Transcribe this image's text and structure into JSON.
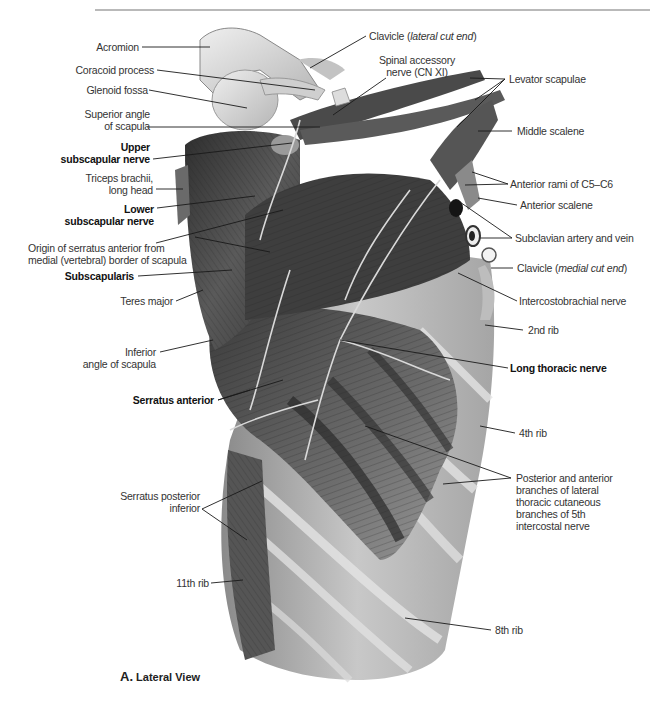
{
  "figure": {
    "caption_letter": "A.",
    "caption_text": "Lateral View",
    "palette": {
      "background": "#ffffff",
      "label_text": "#333333",
      "leader_line": "#1a1a1a",
      "muscle_dark": "#3a3a3a",
      "muscle_mid": "#7a7a7a",
      "bone_light": "#d8d8d8",
      "topline": "#b9b9b9"
    }
  },
  "labels_left": [
    {
      "id": "acromion",
      "lines": [
        "Acromion"
      ],
      "bold": false
    },
    {
      "id": "coracoid-process",
      "lines": [
        "Coracoid process"
      ],
      "bold": false
    },
    {
      "id": "glenoid-fossa",
      "lines": [
        "Glenoid fossa"
      ],
      "bold": false
    },
    {
      "id": "superior-angle-of-scapula",
      "lines": [
        "Superior angle",
        "of scapula"
      ],
      "bold": false
    },
    {
      "id": "upper-subscapular-nerve",
      "lines": [
        "Upper",
        "subscapular nerve"
      ],
      "bold": true
    },
    {
      "id": "triceps-brachii-long-head",
      "lines": [
        "Triceps brachii,",
        "long head"
      ],
      "bold": false
    },
    {
      "id": "lower-subscapular-nerve",
      "lines": [
        "Lower",
        "subscapular nerve"
      ],
      "bold": true
    },
    {
      "id": "origin-serratus-anterior",
      "lines": [
        "Origin of serratus anterior from",
        "medial (vertebral) border of scapula"
      ],
      "bold": false
    },
    {
      "id": "subscapularis",
      "lines": [
        "Subscapularis"
      ],
      "bold": true
    },
    {
      "id": "teres-major",
      "lines": [
        "Teres major"
      ],
      "bold": false
    },
    {
      "id": "inferior-angle-of-scapula",
      "lines": [
        "Inferior",
        "angle of scapula"
      ],
      "bold": false
    },
    {
      "id": "serratus-anterior",
      "lines": [
        "Serratus anterior"
      ],
      "bold": true
    },
    {
      "id": "serratus-posterior-inferior",
      "lines": [
        "Serratus posterior",
        "inferior"
      ],
      "bold": false
    },
    {
      "id": "11th-rib",
      "lines": [
        "11th rib"
      ],
      "bold": false
    }
  ],
  "labels_top": [
    {
      "id": "clavicle-lateral",
      "prefix": "Clavicle (",
      "italic": "lateral cut end",
      "suffix": ")"
    },
    {
      "id": "spinal-accessory-nerve",
      "lines": [
        "Spinal accessory",
        "nerve (CN XI)"
      ]
    }
  ],
  "labels_right": [
    {
      "id": "levator-scapulae",
      "lines": [
        "Levator scapulae"
      ],
      "bold": false
    },
    {
      "id": "middle-scalene",
      "lines": [
        "Middle scalene"
      ],
      "bold": false
    },
    {
      "id": "anterior-rami-c5-c6",
      "lines": [
        "Anterior rami of C5–C6"
      ],
      "bold": false
    },
    {
      "id": "anterior-scalene",
      "lines": [
        "Anterior scalene"
      ],
      "bold": false
    },
    {
      "id": "subclavian-artery-vein",
      "lines": [
        "Subclavian artery and vein"
      ],
      "bold": false
    },
    {
      "id": "clavicle-medial",
      "prefix": "Clavicle (",
      "italic": "medial cut end",
      "suffix": ")"
    },
    {
      "id": "intercostobrachial-nerve",
      "lines": [
        "Intercostobrachial nerve"
      ],
      "bold": false
    },
    {
      "id": "2nd-rib",
      "lines": [
        "2nd rib"
      ],
      "bold": false
    },
    {
      "id": "long-thoracic-nerve",
      "lines": [
        "Long thoracic nerve"
      ],
      "bold": true
    },
    {
      "id": "4th-rib",
      "lines": [
        "4th rib"
      ],
      "bold": false
    },
    {
      "id": "posterior-anterior-branches",
      "lines": [
        "Posterior and anterior",
        "branches of lateral",
        "thoracic cutaneous",
        "branches of 5th",
        "intercostal nerve"
      ],
      "bold": false
    },
    {
      "id": "8th-rib",
      "lines": [
        "8th rib"
      ],
      "bold": false
    }
  ]
}
